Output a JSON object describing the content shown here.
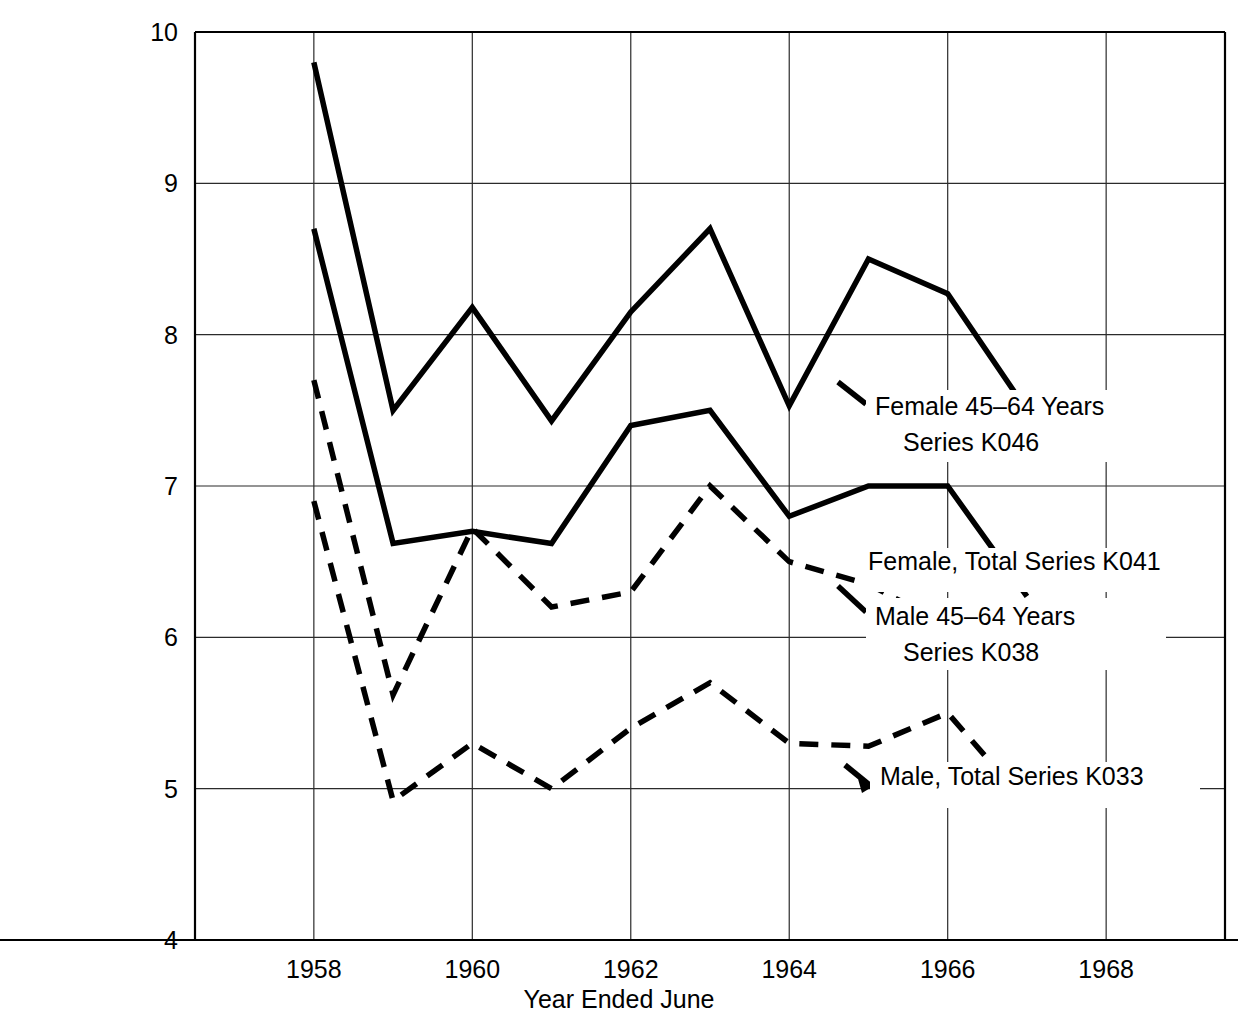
{
  "chart_data": {
    "type": "line",
    "title": "",
    "xlabel": "Year Ended June",
    "ylabel": "",
    "xlim": [
      1956.5,
      1969.5
    ],
    "ylim": [
      4,
      10
    ],
    "grid": true,
    "legend_position": "inline-right",
    "x_ticks": [
      "1958",
      "1960",
      "1962",
      "1964",
      "1966",
      "1968"
    ],
    "x_tick_values": [
      1958,
      1960,
      1962,
      1964,
      1966,
      1968
    ],
    "y_ticks": [
      "4",
      "5",
      "6",
      "7",
      "8",
      "9",
      "10"
    ],
    "y_tick_values": [
      4,
      5,
      6,
      7,
      8,
      9,
      10
    ],
    "x": [
      1958,
      1959,
      1960,
      1961,
      1962,
      1963,
      1964,
      1965,
      1966,
      1967
    ],
    "series": [
      {
        "name": "Female 45-64 Years Series K046",
        "label_line1": "Female 45–64 Years",
        "label_line2": "Series K046",
        "style": "solid",
        "color": "#000000",
        "values": [
          9.8,
          7.5,
          8.18,
          7.43,
          8.15,
          8.7,
          7.53,
          8.5,
          8.27,
          7.5
        ]
      },
      {
        "name": "Female, Total Series K041",
        "label_line1": "Female, Total Series K041",
        "label_line2": "",
        "style": "solid",
        "color": "#000000",
        "values": [
          8.7,
          6.62,
          6.7,
          6.62,
          7.4,
          7.5,
          6.8,
          7.0,
          7.0,
          6.27
        ]
      },
      {
        "name": "Male 45-64 Years Series K038",
        "label_line1": "Male 45–64 Years",
        "label_line2": "Series K038",
        "style": "dashed",
        "color": "#000000",
        "values": [
          7.7,
          5.62,
          6.72,
          6.2,
          6.3,
          7.0,
          6.5,
          6.35,
          6.08,
          6.2
        ]
      },
      {
        "name": "Male, Total Series K033",
        "label_line1": "Male, Total Series K033",
        "label_line2": "",
        "style": "dashed",
        "color": "#000000",
        "values": [
          6.9,
          4.92,
          5.3,
          5.0,
          5.4,
          5.7,
          5.3,
          5.28,
          5.5,
          4.9
        ]
      }
    ],
    "annotations": [
      {
        "id": "label-k046",
        "text_line1": "Female 45–64 Years",
        "text_line2": "Series K046",
        "x": 875,
        "y": 415
      },
      {
        "id": "label-k041",
        "text_line1": "Female, Total Series K041",
        "text_line2": "",
        "x": 868,
        "y": 570
      },
      {
        "id": "label-k038",
        "text_line1": "Male 45–64 Years",
        "text_line2": "Series K038",
        "x": 875,
        "y": 625
      },
      {
        "id": "label-k033",
        "text_line1": "Male, Total Series K033",
        "text_line2": "",
        "x": 880,
        "y": 785
      }
    ]
  },
  "axis": {
    "x_title": "Year Ended June"
  }
}
